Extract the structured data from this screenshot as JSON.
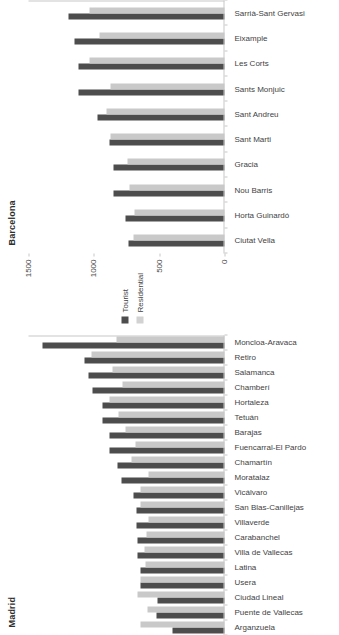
{
  "figure": {
    "legend": {
      "items": [
        {
          "label": "Tourist",
          "color": "#4d4d4d",
          "swatch": "tourist-swatch"
        },
        {
          "label": "Residential",
          "color": "#d2d2d2",
          "swatch": "residential-swatch"
        }
      ]
    }
  },
  "chart_data": [
    {
      "type": "bar",
      "title": "Madrid",
      "xlabel": "",
      "ylabel": "",
      "ylim": [
        0,
        1500
      ],
      "yticks": [
        0,
        500,
        1000,
        1500
      ],
      "ytick_labels": [
        "0",
        "500",
        "1000",
        "1500"
      ],
      "grid": false,
      "legend_position": "center-between-panels",
      "orientation": "vertical-bars-rotated-90",
      "categories": [
        "Arganzuela",
        "Puente de Vallecas",
        "Ciudad Lineal",
        "Usera",
        "Latina",
        "Villa de Vallecas",
        "Carabanchel",
        "Villaverde",
        "San Blas-Canillejas",
        "Vicálvaro",
        "Moratalaz",
        "Chamartín",
        "Fuencarral-El Pardo",
        "Barajas",
        "Tetuán",
        "Hortaleza",
        "Chamberí",
        "Salamanca",
        "Retiro",
        "Moncloa-Aravaca"
      ],
      "series": [
        {
          "name": "Tourist",
          "color": "#4d4d4d",
          "values": [
            395,
            520,
            515,
            640,
            640,
            665,
            665,
            675,
            675,
            700,
            790,
            820,
            880,
            880,
            935,
            935,
            1010,
            1040,
            1070,
            1390
          ]
        },
        {
          "name": "Residential",
          "color": "#c9c9c9",
          "values": [
            640,
            590,
            665,
            640,
            605,
            610,
            595,
            585,
            640,
            645,
            585,
            715,
            680,
            760,
            810,
            880,
            780,
            855,
            1020,
            830
          ]
        }
      ]
    },
    {
      "type": "bar",
      "title": "Barcelona",
      "xlabel": "",
      "ylabel": "",
      "ylim": [
        0,
        1500
      ],
      "yticks": [
        0,
        500,
        1000,
        1500
      ],
      "ytick_labels": [
        "0",
        "500",
        "1000",
        "1500"
      ],
      "grid": false,
      "legend_position": "center-between-panels",
      "orientation": "vertical-bars-rotated-90",
      "categories": [
        "Ciutat Vella",
        "Horta Guinardó",
        "Nou Barris",
        "Gracia",
        "Sant Marti",
        "Sant Andreu",
        "Sants Monjuic",
        "Les Corts",
        "Eixample",
        "Sarrià-Sant Gervasi"
      ],
      "series": [
        {
          "name": "Tourist",
          "color": "#4d4d4d",
          "values": [
            735,
            760,
            850,
            850,
            880,
            975,
            1120,
            1115,
            1145,
            1195
          ]
        },
        {
          "name": "Residential",
          "color": "#c9c9c9",
          "values": [
            700,
            690,
            730,
            745,
            870,
            900,
            870,
            1035,
            960,
            1030
          ]
        }
      ]
    }
  ]
}
